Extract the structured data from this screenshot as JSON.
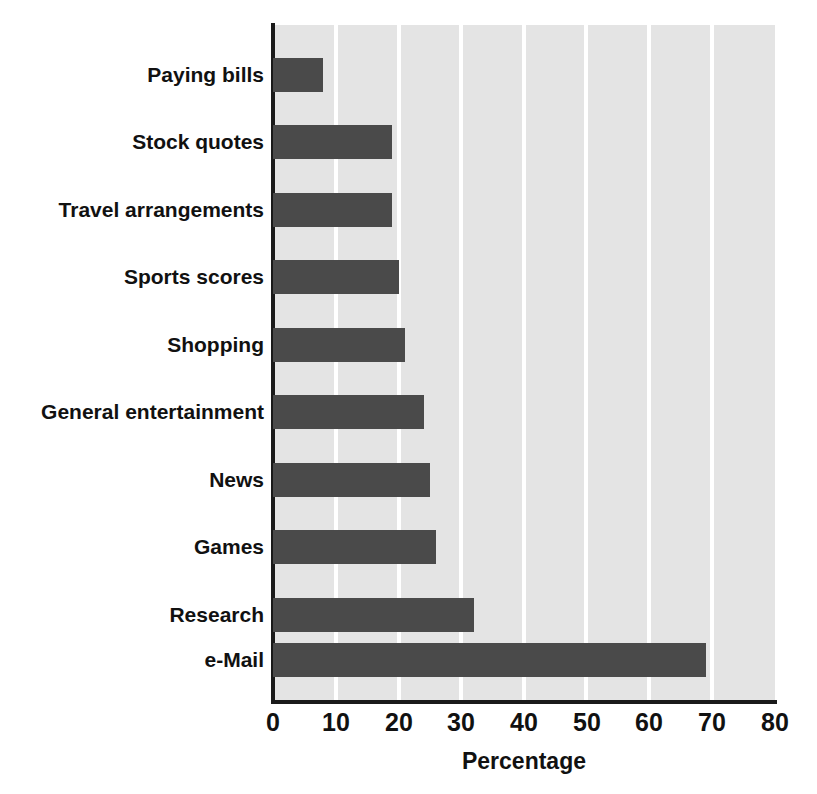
{
  "chart_data": {
    "type": "bar",
    "orientation": "horizontal",
    "title": "",
    "xlabel": "Percentage",
    "ylabel": "",
    "xlim": [
      0,
      80
    ],
    "xticks": [
      0,
      10,
      20,
      30,
      40,
      50,
      60,
      70,
      80
    ],
    "grid": true,
    "legend": "none",
    "categories": [
      "Paying bills",
      "Stock quotes",
      "Travel arrangements",
      "Sports scores",
      "Shopping",
      "General entertainment",
      "News",
      "Games",
      "Research",
      "e-Mail"
    ],
    "values": [
      8,
      19,
      19,
      20,
      21,
      24,
      25,
      26,
      32,
      69
    ],
    "bar_color": "#4a4a4a",
    "plot_background": "#e4e4e4",
    "gridline_color": "#ffffff",
    "axis_color": "#1a1a1a"
  }
}
